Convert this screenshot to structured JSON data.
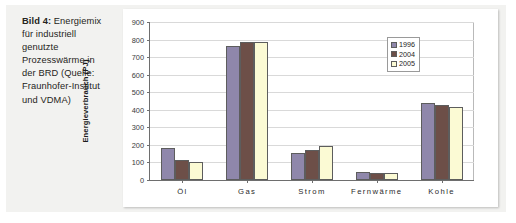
{
  "caption": {
    "lead": "Bild 4:",
    "body": "Energiemix für industriell genutzte Prozesswärme in der BRD (Quelle: Fraunhofer-Institut und VDMA)"
  },
  "colors": {
    "series_1996": "#8f87ab",
    "series_2004": "#6d4f48",
    "series_2005": "#fbfad4",
    "panel_background": "#f2f2f0",
    "chart_background": "#ffffff",
    "gridline": "#d9d9d9",
    "axis": "#6e6e6e"
  },
  "chart_data": {
    "type": "bar",
    "title": "",
    "xlabel": "",
    "ylabel": "Energieverbrauch (PJ)",
    "ylim": [
      0,
      900
    ],
    "ytick_step": 100,
    "yticks": [
      0,
      100,
      200,
      300,
      400,
      500,
      600,
      700,
      800,
      900
    ],
    "grid": true,
    "legend_position": "top-right-inside",
    "categories": [
      "Öl",
      "Gas",
      "Strom",
      "Fernwärme",
      "Kohle"
    ],
    "series": [
      {
        "name": "1996",
        "values": [
          180,
          765,
          155,
          45,
          440
        ]
      },
      {
        "name": "2004",
        "values": [
          115,
          785,
          170,
          42,
          425
        ]
      },
      {
        "name": "2005",
        "values": [
          105,
          785,
          195,
          38,
          415
        ]
      }
    ]
  }
}
